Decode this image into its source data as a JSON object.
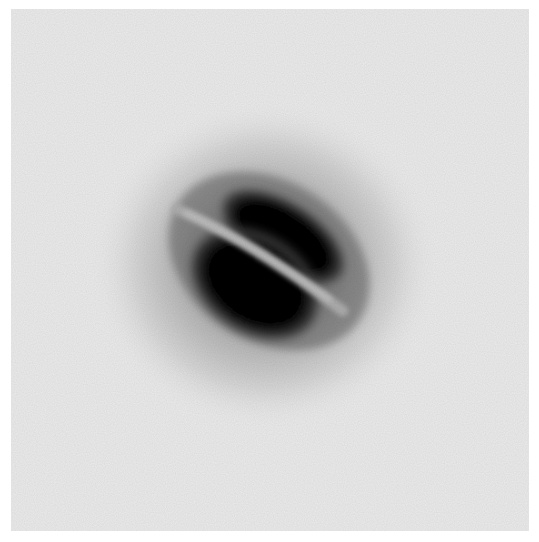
{
  "image": {
    "subject": "inverted grayscale image of a galaxy with a dust lane",
    "alt_text": "Dark elliptical galaxy bisected diagonally by a bright dust lane on a light gray background",
    "colors": {
      "margin": "#ffffff",
      "background": "#ececec",
      "halo_outer": "#d6d6d6",
      "halo_inner": "#8a8a8a",
      "core": "#050505",
      "dust_lane": "#a8a8a8"
    },
    "features": {
      "halo": {
        "cx": 254,
        "cy": 256,
        "rx": 175,
        "ry": 165
      },
      "upper_lobe": {
        "cx": 272,
        "cy": 228,
        "rx": 72,
        "ry": 36,
        "rotation": 33
      },
      "lower_lobe": {
        "cx": 244,
        "cy": 275,
        "rx": 72,
        "ry": 50,
        "rotation": 33
      },
      "dust_lane": {
        "x1": 168,
        "y1": 200,
        "x2": 330,
        "y2": 300,
        "width": 10
      }
    }
  }
}
